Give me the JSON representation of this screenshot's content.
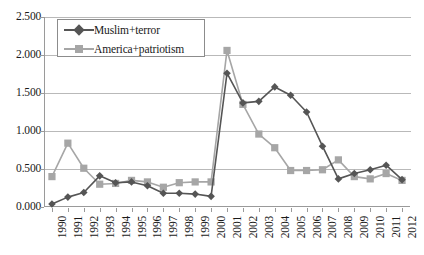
{
  "chart_data": {
    "type": "line",
    "title": "",
    "subtitle": "",
    "xlabel": "",
    "ylabel": "",
    "grid": true,
    "legend_position": "top-left-inside",
    "ylim": [
      0.0,
      2.5
    ],
    "ytick_labels": [
      "0.000",
      "0.500",
      "1.000",
      "1.500",
      "2.000",
      "2.500"
    ],
    "ytick_values": [
      0.0,
      0.5,
      1.0,
      1.5,
      2.0,
      2.5
    ],
    "categories": [
      "1990",
      "1991",
      "1992",
      "1993",
      "1994",
      "1995",
      "1996",
      "1997",
      "1998",
      "1999",
      "2000",
      "2001",
      "2002",
      "2003",
      "2004",
      "2005",
      "2006",
      "2007",
      "2008",
      "2009",
      "2010",
      "2011",
      "2012"
    ],
    "series": [
      {
        "name": "Muslim+terror",
        "color": "#555555",
        "marker": "diamond",
        "values": [
          0.04,
          0.13,
          0.19,
          0.41,
          0.32,
          0.33,
          0.28,
          0.18,
          0.18,
          0.17,
          0.14,
          1.76,
          1.37,
          1.39,
          1.58,
          1.47,
          1.25,
          0.8,
          0.37,
          0.44,
          0.49,
          0.55,
          0.36
        ]
      },
      {
        "name": "America+patriotism",
        "color": "#a6a6a6",
        "marker": "square",
        "values": [
          0.4,
          0.84,
          0.51,
          0.3,
          0.31,
          0.35,
          0.33,
          0.26,
          0.32,
          0.33,
          0.33,
          2.06,
          1.35,
          0.96,
          0.78,
          0.48,
          0.48,
          0.49,
          0.62,
          0.4,
          0.37,
          0.44,
          0.35
        ]
      }
    ]
  },
  "legend": {
    "items": [
      {
        "label": "Muslim+terror"
      },
      {
        "label": "America+patriotism"
      }
    ]
  },
  "colors": {
    "series_dark": "#555555",
    "series_light": "#a6a6a6",
    "gridline": "#b9b9b9",
    "axis": "#9a9a9a",
    "background": "#ffffff",
    "text": "#1a1a1a"
  }
}
